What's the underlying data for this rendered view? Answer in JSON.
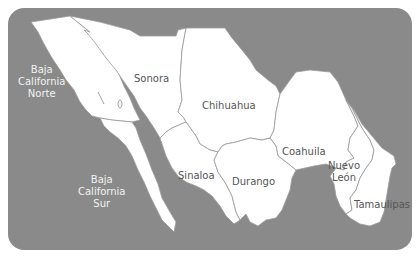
{
  "map": {
    "colors": {
      "water": "#8a8a8a",
      "land": "#ffffff",
      "border": "#9a9a9a",
      "land_label": "#555555",
      "water_label": "#f2f2f2"
    },
    "states": [
      {
        "id": "baja-california-norte",
        "label_lines": [
          "Baja",
          "California",
          "Norte"
        ]
      },
      {
        "id": "baja-california-sur",
        "label_lines": [
          "Baja",
          "California",
          "Sur"
        ]
      },
      {
        "id": "sonora",
        "label_lines": [
          "Sonora"
        ]
      },
      {
        "id": "chihuahua",
        "label_lines": [
          "Chihuahua"
        ]
      },
      {
        "id": "coahuila",
        "label_lines": [
          "Coahuila"
        ]
      },
      {
        "id": "sinaloa",
        "label_lines": [
          "Sinaloa"
        ]
      },
      {
        "id": "durango",
        "label_lines": [
          "Durango"
        ]
      },
      {
        "id": "nuevo-leon",
        "label_lines": [
          "Nuevo",
          "León"
        ]
      },
      {
        "id": "tamaulipas",
        "label_lines": [
          "Tamaulipas"
        ]
      }
    ]
  }
}
